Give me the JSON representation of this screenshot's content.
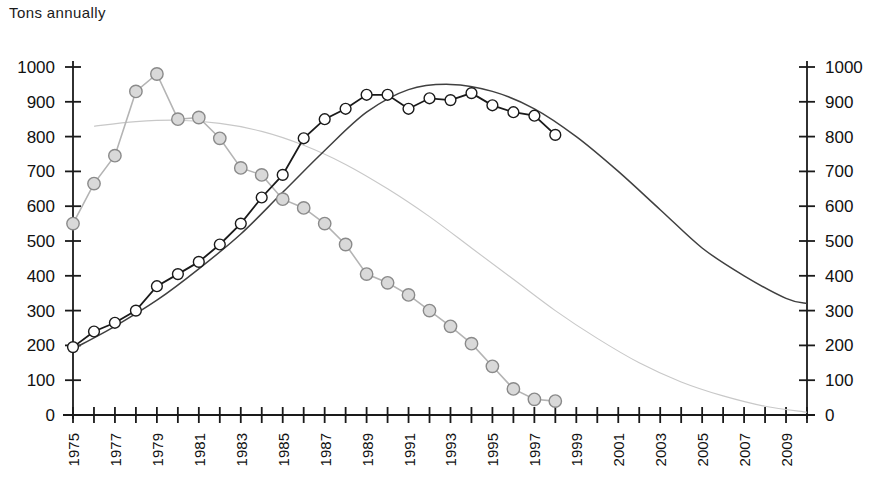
{
  "chart_title": "Tons annually",
  "axes": {
    "y_left_ticks": [
      "0",
      "100",
      "200",
      "300",
      "400",
      "500",
      "600",
      "700",
      "800",
      "900",
      "1000"
    ],
    "y_right_ticks": [
      "0",
      "100",
      "200",
      "300",
      "400",
      "500",
      "600",
      "700",
      "800",
      "900",
      "1000"
    ],
    "x_ticks": [
      "1975",
      "1977",
      "1979",
      "1981",
      "1983",
      "1985",
      "1987",
      "1989",
      "1991",
      "1993",
      "1995",
      "1997",
      "1999",
      "2001",
      "2003",
      "2005",
      "2007",
      "2009"
    ]
  },
  "colors": {
    "series_declining_line": "#b4b4b4",
    "series_rising_line": "#1a1a1a",
    "trend_declining": "#c8c8c8",
    "trend_rising": "#404040",
    "marker_fill": "#d9d9d9",
    "marker_fill_light": "#ffffff",
    "axis": "#1a1a1a"
  },
  "chart_data": {
    "type": "line",
    "title": "Tons annually",
    "xlabel": "",
    "ylabel": "Tons annually",
    "xlim": [
      1975,
      2010
    ],
    "ylim": [
      0,
      1000
    ],
    "grid": false,
    "legend": "none",
    "x": [
      1975,
      1976,
      1977,
      1978,
      1979,
      1980,
      1981,
      1982,
      1983,
      1984,
      1985,
      1986,
      1987,
      1988,
      1989,
      1990,
      1991,
      1992,
      1993,
      1994,
      1995,
      1996,
      1997,
      1998
    ],
    "series": [
      {
        "name": "Declining series",
        "marker": "circle",
        "values": [
          550,
          665,
          745,
          930,
          980,
          850,
          855,
          795,
          710,
          690,
          620,
          595,
          550,
          490,
          405,
          380,
          345,
          300,
          255,
          205,
          140,
          75,
          45,
          40
        ]
      },
      {
        "name": "Rising series",
        "marker": "circle",
        "values": [
          195,
          240,
          265,
          300,
          370,
          405,
          440,
          490,
          550,
          625,
          690,
          795,
          850,
          880,
          920,
          920,
          880,
          910,
          905,
          925,
          890,
          870,
          860,
          805
        ]
      }
    ],
    "trendlines": [
      {
        "name": "Declining trend",
        "style": "thin-grey",
        "x": [
          1976,
          1978,
          1980,
          1982,
          1984,
          1986,
          1988,
          1990,
          1992,
          1994,
          1996,
          1998,
          2000,
          2002,
          2004,
          2006,
          2008,
          2010
        ],
        "values": [
          830,
          843,
          847,
          838,
          815,
          775,
          720,
          650,
          570,
          480,
          390,
          300,
          220,
          150,
          95,
          55,
          25,
          8
        ]
      },
      {
        "name": "Rising trend",
        "style": "thin-dark",
        "x": [
          1975,
          1977,
          1979,
          1981,
          1983,
          1985,
          1987,
          1989,
          1991,
          1993,
          1995,
          1997,
          1999,
          2001,
          2003,
          2005,
          2007,
          2009,
          2010
        ],
        "values": [
          190,
          255,
          330,
          420,
          520,
          640,
          760,
          870,
          935,
          950,
          930,
          880,
          800,
          700,
          590,
          480,
          400,
          335,
          320
        ]
      }
    ]
  }
}
